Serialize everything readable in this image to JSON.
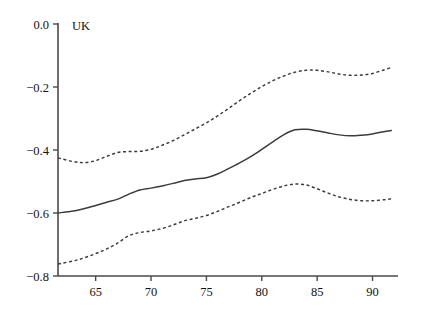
{
  "chart_data": {
    "type": "line",
    "title": "UK",
    "xlabel": "",
    "ylabel": "",
    "xlim": [
      61.6,
      92.3
    ],
    "ylim": [
      -0.8,
      0.0
    ],
    "grid": false,
    "legend": "none",
    "panel_label": "UK",
    "x_ticks": [
      65,
      70,
      75,
      80,
      85,
      90
    ],
    "x_tick_labels": [
      "65",
      "70",
      "75",
      "80",
      "85",
      "90"
    ],
    "y_ticks": [
      0.0,
      -0.2,
      -0.4,
      -0.6,
      -0.8
    ],
    "y_tick_labels": [
      "0.0",
      "−0.2",
      "−0.4",
      "−0.6",
      "−0.8"
    ],
    "x": [
      61.6,
      63,
      64,
      65,
      66,
      67,
      68,
      69,
      70,
      71,
      72,
      73,
      74,
      75,
      76,
      77,
      78,
      79,
      80,
      81,
      82,
      83,
      84,
      85,
      86,
      87,
      88,
      89,
      90,
      91,
      91.7
    ],
    "series": [
      {
        "name": "upper-confidence-band",
        "style": "dashed",
        "values": [
          -0.425,
          -0.437,
          -0.44,
          -0.434,
          -0.42,
          -0.408,
          -0.405,
          -0.404,
          -0.398,
          -0.385,
          -0.37,
          -0.352,
          -0.333,
          -0.314,
          -0.292,
          -0.268,
          -0.243,
          -0.22,
          -0.199,
          -0.18,
          -0.165,
          -0.153,
          -0.147,
          -0.147,
          -0.152,
          -0.159,
          -0.163,
          -0.162,
          -0.157,
          -0.146,
          -0.138
        ]
      },
      {
        "name": "point-estimate",
        "style": "solid",
        "values": [
          -0.6,
          -0.594,
          -0.586,
          -0.576,
          -0.566,
          -0.556,
          -0.54,
          -0.527,
          -0.521,
          -0.514,
          -0.506,
          -0.497,
          -0.492,
          -0.488,
          -0.476,
          -0.459,
          -0.441,
          -0.421,
          -0.398,
          -0.374,
          -0.351,
          -0.336,
          -0.334,
          -0.339,
          -0.346,
          -0.352,
          -0.355,
          -0.353,
          -0.349,
          -0.342,
          -0.338
        ]
      },
      {
        "name": "lower-confidence-band",
        "style": "dashed",
        "values": [
          -0.762,
          -0.752,
          -0.742,
          -0.729,
          -0.714,
          -0.695,
          -0.672,
          -0.662,
          -0.657,
          -0.649,
          -0.638,
          -0.625,
          -0.617,
          -0.608,
          -0.595,
          -0.58,
          -0.566,
          -0.551,
          -0.538,
          -0.525,
          -0.514,
          -0.508,
          -0.511,
          -0.523,
          -0.537,
          -0.549,
          -0.557,
          -0.561,
          -0.561,
          -0.558,
          -0.555
        ]
      }
    ]
  }
}
